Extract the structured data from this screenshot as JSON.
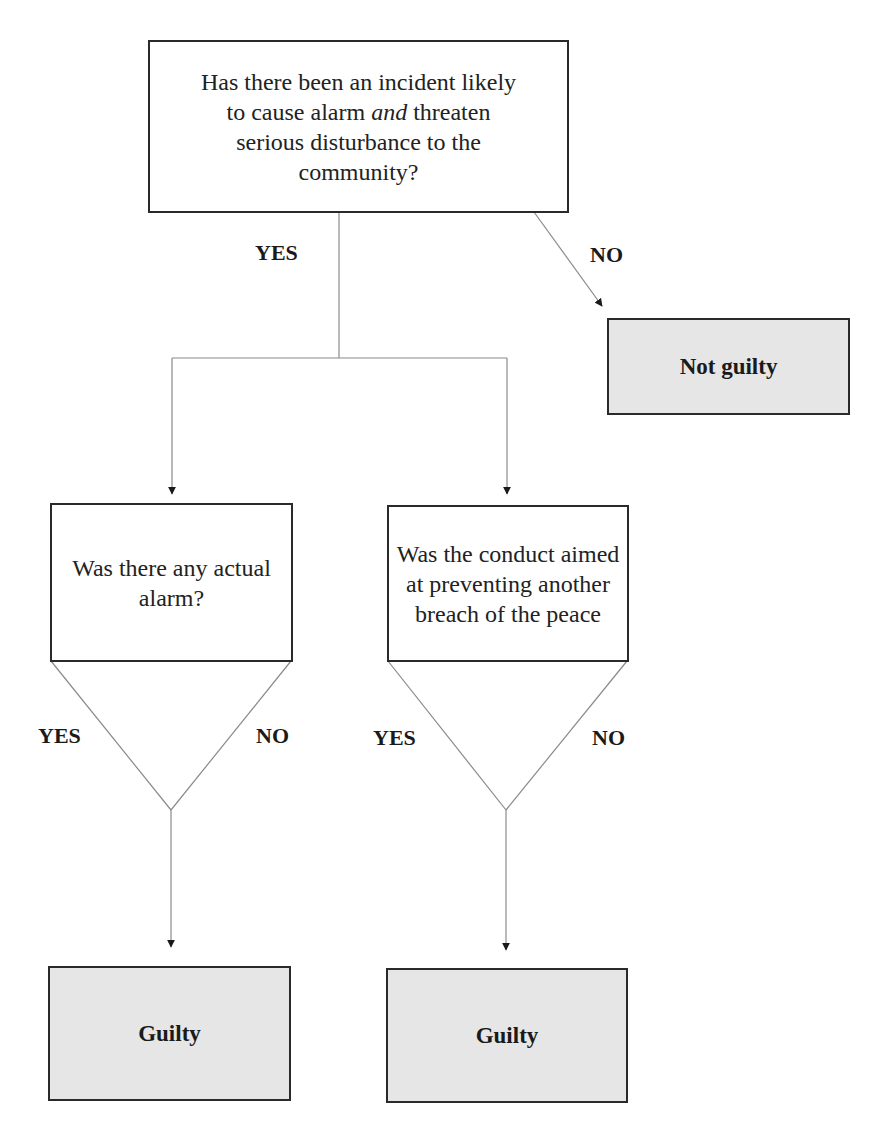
{
  "title": "BREACH OF THE PEACE",
  "nodes": {
    "q1": {
      "type": "question",
      "text_before": "Has there been an incident likely to cause alarm ",
      "text_emphasis": "and",
      "text_after": " threaten serious disturbance to the community?"
    },
    "q2": {
      "type": "question",
      "text": "Was there any actual alarm?"
    },
    "q3": {
      "type": "question",
      "text": "Was the conduct aimed at preventing another breach of the peace"
    },
    "o1": {
      "type": "outcome",
      "text": "Not guilty"
    },
    "o2": {
      "type": "outcome",
      "text": "Guilty"
    },
    "o3": {
      "type": "outcome",
      "text": "Guilty"
    }
  },
  "edges": [
    {
      "from": "q1",
      "to": "o1",
      "label": "NO"
    },
    {
      "from": "q1",
      "to": "q2",
      "label": "YES"
    },
    {
      "from": "q1",
      "to": "q3",
      "label": "YES"
    },
    {
      "from": "q2",
      "to": "o2",
      "label": "YES"
    },
    {
      "from": "q2",
      "to": "o2",
      "label": "NO"
    },
    {
      "from": "q3",
      "to": "o3",
      "label": "YES"
    },
    {
      "from": "q3",
      "to": "o3",
      "label": "NO"
    }
  ],
  "labels": {
    "q1_yes": "YES",
    "q1_no": "NO",
    "q2_yes": "YES",
    "q2_no": "NO",
    "q3_yes": "YES",
    "q3_no": "NO"
  },
  "colors": {
    "outcome_fill": "#e6e6e6",
    "border": "#2a2a2a",
    "connector": "#8a8a8a"
  }
}
